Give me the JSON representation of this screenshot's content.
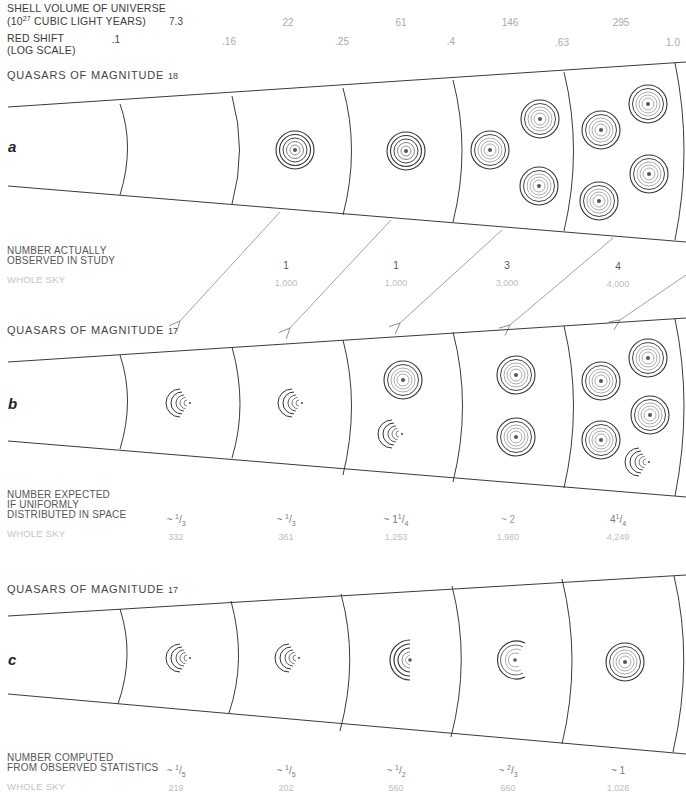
{
  "axes": {
    "shell_volume_label_line1": "SHELL VOLUME OF UNIVERSE",
    "shell_volume_label_line2_pre": "(10",
    "shell_volume_label_exp": "27",
    "shell_volume_label_line2_post": " CUBIC LIGHT YEARS)",
    "shell_volumes": [
      "7.3",
      "22",
      "61",
      "146",
      "295"
    ],
    "red_shift_label_line1": "RED SHIFT",
    "red_shift_label_line2": "(LOG SCALE)",
    "red_shifts": [
      ".1",
      ".16",
      ".25",
      ".4",
      ".63",
      "1.0"
    ]
  },
  "panels": {
    "a": {
      "letter": "a",
      "heading": "QUASARS OF MAGNITUDE",
      "magnitude": "18",
      "row_label_line1": "NUMBER ACTUALLY",
      "row_label_line2": "OBSERVED IN STUDY",
      "whole_sky_label": "WHOLE SKY",
      "counts": [
        "1",
        "1",
        "3",
        "4"
      ],
      "whole_sky": [
        "1,000",
        "1,000",
        "3,000",
        "4,000"
      ]
    },
    "b": {
      "letter": "b",
      "heading": "QUASARS OF MAGNITUDE",
      "magnitude": "17",
      "row_label_line1": "NUMBER EXPECTED",
      "row_label_line2": "IF UNIFORMLY",
      "row_label_line3": "DISTRIBUTED IN SPACE",
      "whole_sky_label": "WHOLE SKY",
      "counts": [
        {
          "prefix": "~ ",
          "whole": "",
          "num": "1",
          "den": "3"
        },
        {
          "prefix": "~ ",
          "whole": "",
          "num": "1",
          "den": "3"
        },
        {
          "prefix": "~ ",
          "whole": "1",
          "num": "1",
          "den": "4"
        },
        {
          "prefix": "~ ",
          "whole": "2",
          "num": "",
          "den": ""
        },
        {
          "prefix": "",
          "whole": "4",
          "num": "1",
          "den": "4"
        }
      ],
      "whole_sky": [
        "332",
        "361",
        "1,253",
        "1,980",
        "4,249"
      ]
    },
    "c": {
      "letter": "c",
      "heading": "QUASARS OF MAGNITUDE",
      "magnitude": "17",
      "row_label_line1": "NUMBER COMPUTED",
      "row_label_line2": "FROM OBSERVED STATISTICS",
      "whole_sky_label": "WHOLE SKY",
      "counts": [
        {
          "prefix": "~ ",
          "whole": "",
          "num": "1",
          "den": "5"
        },
        {
          "prefix": "~ ",
          "whole": "",
          "num": "1",
          "den": "5"
        },
        {
          "prefix": "~ ",
          "whole": "",
          "num": "1",
          "den": "2"
        },
        {
          "prefix": "~ ",
          "whole": "",
          "num": "2",
          "den": "3"
        },
        {
          "prefix": "~ ",
          "whole": "1",
          "num": "",
          "den": ""
        }
      ],
      "whole_sky": [
        "219",
        "202",
        "560",
        "660",
        "1,026"
      ]
    }
  },
  "colors": {
    "line": "#3a3a3a",
    "arrow": "#8a8a8a",
    "light_text": "#bdbdbd"
  }
}
